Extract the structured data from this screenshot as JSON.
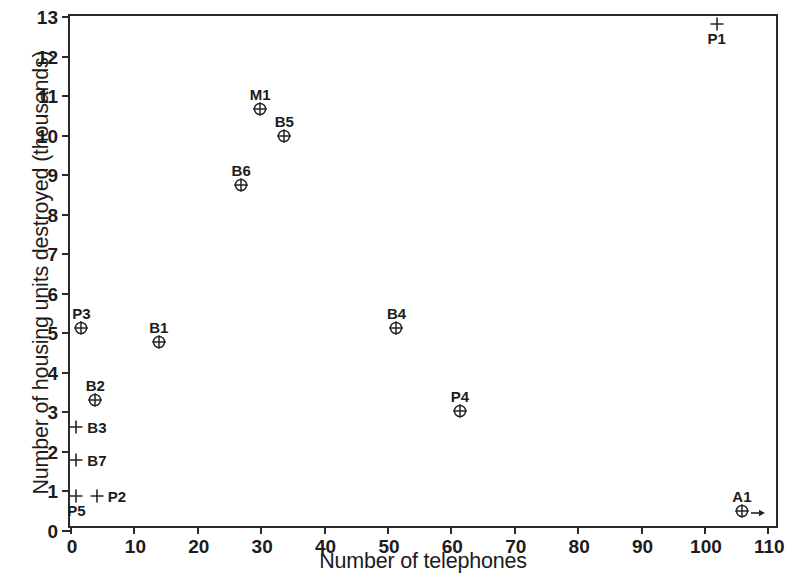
{
  "chart_data": {
    "type": "scatter",
    "title": "",
    "xlabel": "Number of telephones",
    "ylabel": "Number of housing units destroyed (thousands)",
    "xlim": [
      0,
      112
    ],
    "ylim": [
      0,
      13
    ],
    "xticks": [
      0,
      10,
      20,
      30,
      40,
      50,
      60,
      70,
      80,
      90,
      100,
      110
    ],
    "yticks": [
      0,
      1,
      2,
      3,
      4,
      5,
      6,
      7,
      8,
      9,
      10,
      11,
      12,
      13
    ],
    "grid": false,
    "legend": "none",
    "points": [
      {
        "label": "P1",
        "x": 102,
        "y": 12.8,
        "marker": "plus",
        "label_pos": "below",
        "arrow": false
      },
      {
        "label": "M1",
        "x": 30,
        "y": 10.65,
        "marker": "circle-plus",
        "label_pos": "above",
        "arrow": false
      },
      {
        "label": "B5",
        "x": 33.8,
        "y": 9.97,
        "marker": "circle-plus",
        "label_pos": "above",
        "arrow": false
      },
      {
        "label": "B6",
        "x": 27,
        "y": 8.72,
        "marker": "circle-plus",
        "label_pos": "above",
        "arrow": false
      },
      {
        "label": "B4",
        "x": 51.5,
        "y": 5.12,
        "marker": "circle-plus",
        "label_pos": "above",
        "arrow": false
      },
      {
        "label": "P3",
        "x": 1.8,
        "y": 5.1,
        "marker": "circle-plus",
        "label_pos": "above",
        "arrow": false
      },
      {
        "label": "B1",
        "x": 14,
        "y": 4.75,
        "marker": "circle-plus",
        "label_pos": "above",
        "arrow": false
      },
      {
        "label": "B2",
        "x": 4,
        "y": 3.3,
        "marker": "circle-plus",
        "label_pos": "above",
        "arrow": false
      },
      {
        "label": "P4",
        "x": 61.5,
        "y": 3.0,
        "marker": "circle-plus",
        "label_pos": "above",
        "arrow": false
      },
      {
        "label": "B3",
        "x": 1,
        "y": 2.6,
        "marker": "plus",
        "label_pos": "right",
        "arrow": false
      },
      {
        "label": "B7",
        "x": 1,
        "y": 1.78,
        "marker": "plus",
        "label_pos": "right",
        "arrow": false
      },
      {
        "label": "P2",
        "x": 4.2,
        "y": 0.85,
        "marker": "plus",
        "label_pos": "right",
        "arrow": false
      },
      {
        "label": "P5",
        "x": 1,
        "y": 0.85,
        "marker": "plus",
        "label_pos": "below",
        "arrow": false
      },
      {
        "label": "A1",
        "x": 106,
        "y": 0.48,
        "marker": "circle-plus",
        "label_pos": "above",
        "arrow": true
      }
    ]
  }
}
